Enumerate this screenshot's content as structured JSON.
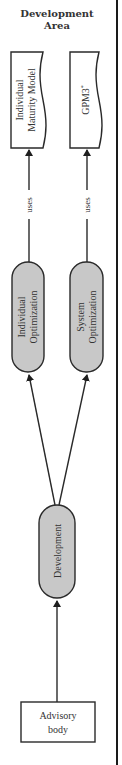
{
  "diagram": {
    "title_line1": "Development",
    "title_line2": "Area",
    "boxes": {
      "individual_maturity_model": {
        "line1": "Individual",
        "line2": "Maturity Model"
      },
      "gpm3": {
        "label": "GPM3",
        "superscript": "*"
      },
      "advisory_body": {
        "line1": "Advisory",
        "line2": "body"
      }
    },
    "processes": {
      "individual_optimization": {
        "line1": "Individual",
        "line2": "Optimization"
      },
      "system_optimization": {
        "line1": "System",
        "line2": "Optimization"
      },
      "development": {
        "label": "Development"
      }
    },
    "edges": {
      "uses_left": "uses",
      "uses_right": "uses"
    },
    "colors": {
      "process_fill": "#c8c8c8",
      "stroke": "#2a2a2a",
      "divider": "#1a1a1a"
    }
  }
}
